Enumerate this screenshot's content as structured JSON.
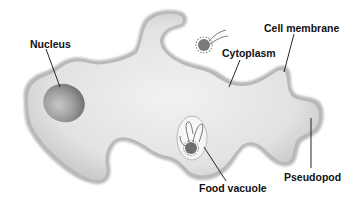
{
  "diagram": {
    "labels": {
      "nucleus": "Nucleus",
      "cytoplasm": "Cytoplasm",
      "cell_membrane": "Cell membrane",
      "food_vacuole": "Food vacuole",
      "pseudopod": "Pseudopod"
    },
    "colors": {
      "cell_fill": "#dcdcdc",
      "cell_edge": "#9a9a9a",
      "nucleus": "#8c8c8c",
      "leader_line": "#111111",
      "background": "#ffffff"
    }
  }
}
